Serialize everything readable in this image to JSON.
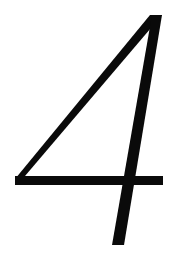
{
  "glyph": {
    "character": "4",
    "stroke_color": "#0a0a0a",
    "background_color": "#ffffff"
  }
}
